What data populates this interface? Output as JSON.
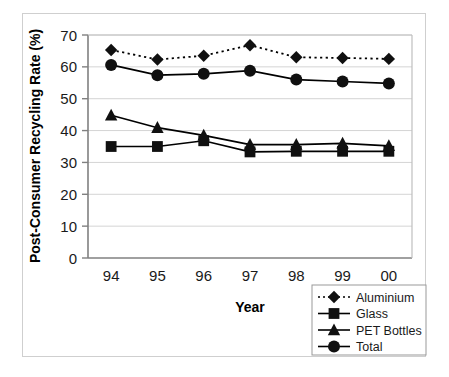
{
  "chart_data": {
    "type": "line",
    "title": "",
    "xlabel": "Year",
    "ylabel": "Post-Consumer Recycling Rate (%)",
    "categories": [
      "94",
      "95",
      "96",
      "97",
      "98",
      "99",
      "00"
    ],
    "ylim": [
      0,
      70
    ],
    "yticks": [
      0,
      10,
      20,
      30,
      40,
      50,
      60,
      70
    ],
    "ytick_labels": [
      "0",
      "10",
      "20",
      "30",
      "40",
      "50",
      "60",
      "70"
    ],
    "grid": true,
    "grid_axis": "y",
    "legend_position": "bottom-right",
    "series": [
      {
        "name": "Aluminium",
        "marker": "diamond",
        "line_style": "dotted",
        "color": "#000000",
        "values": [
          65.3,
          62.3,
          63.5,
          66.8,
          63.0,
          62.8,
          62.5
        ]
      },
      {
        "name": "Glass",
        "marker": "square",
        "line_style": "solid",
        "color": "#000000",
        "values": [
          35.0,
          35.0,
          36.8,
          33.3,
          33.5,
          33.5,
          33.5
        ]
      },
      {
        "name": "PET Bottles",
        "marker": "triangle",
        "line_style": "solid",
        "color": "#000000",
        "values": [
          44.8,
          40.9,
          38.5,
          35.6,
          35.6,
          36.0,
          35.2
        ]
      },
      {
        "name": "Total",
        "marker": "circle",
        "line_style": "solid",
        "color": "#000000",
        "values": [
          60.6,
          57.4,
          57.8,
          58.8,
          56.0,
          55.4,
          54.8
        ]
      }
    ]
  },
  "legend": {
    "entries": [
      {
        "label": "Aluminium"
      },
      {
        "label": "Glass"
      },
      {
        "label": "PET Bottles"
      },
      {
        "label": "Total"
      }
    ]
  },
  "axes": {
    "x_title": "Year",
    "y_title": "Post-Consumer Recycling Rate (%)"
  }
}
